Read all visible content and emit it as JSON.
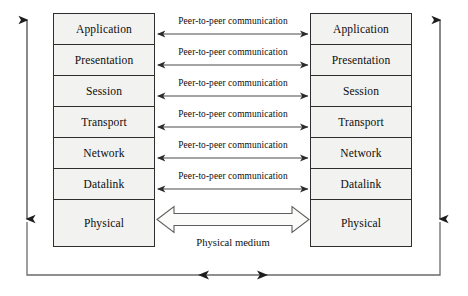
{
  "diagram": {
    "colors": {
      "box_fill": "#f2f2f0",
      "box_stroke": "#2e2e2e",
      "arrow_stroke": "#3a3a3a",
      "text": "#0d0d0d",
      "background": "#ffffff"
    },
    "left_stack": {
      "name": "left-protocol-stack",
      "layers": [
        "Application",
        "Presentation",
        "Session",
        "Transport",
        "Network",
        "Datalink",
        "Physical"
      ]
    },
    "right_stack": {
      "name": "right-protocol-stack",
      "layers": [
        "Application",
        "Presentation",
        "Session",
        "Transport",
        "Network",
        "Datalink",
        "Physical"
      ]
    },
    "peer_links": [
      {
        "label": "Peer-to-peer communication",
        "between": "Application"
      },
      {
        "label": "Peer-to-peer communication",
        "between": "Presentation"
      },
      {
        "label": "Peer-to-peer communication",
        "between": "Session"
      },
      {
        "label": "Peer-to-peer communication",
        "between": "Transport"
      },
      {
        "label": "Peer-to-peer communication",
        "between": "Network"
      },
      {
        "label": "Peer-to-peer communication",
        "between": "Datalink"
      }
    ],
    "physical_medium": {
      "label": "Physical medium",
      "between": "Physical"
    },
    "flow_arrows": {
      "left_vertical": "downward data flow through sending stack",
      "right_vertical": "upward data flow through receiving stack",
      "bottom_horizontal": "bidirectional transmission path"
    }
  }
}
